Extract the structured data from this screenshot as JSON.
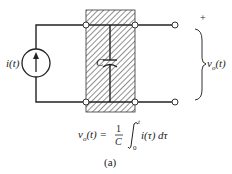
{
  "diagram": {
    "source_label": "i(t)",
    "capacitor_label": "C",
    "plus_sign": "+",
    "output_label_v": "v",
    "output_label_sub": "o",
    "output_label_arg": "(t)",
    "equation": {
      "lhs": "v",
      "lhs_sub": "o",
      "lhs_arg": "(t) =",
      "frac_num": "1",
      "frac_den": "C",
      "integral": "∫",
      "upper_limit": "t",
      "lower_limit": "0",
      "integrand": "i(τ) dτ"
    },
    "caption": "(a)"
  }
}
